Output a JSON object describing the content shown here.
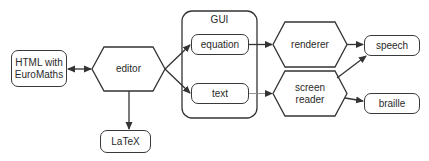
{
  "diagram": {
    "type": "flowchart",
    "nodes": {
      "html": {
        "label_line1": "HTML with",
        "label_line2": "EuroMaths",
        "shape": "rounded-rect"
      },
      "editor": {
        "label": "editor",
        "shape": "hexagon"
      },
      "latex": {
        "label": "LaTeX",
        "shape": "rounded-rect"
      },
      "gui": {
        "label": "GUI",
        "shape": "rounded-container"
      },
      "equation": {
        "label": "equation",
        "shape": "rounded-rect"
      },
      "text": {
        "label": "text",
        "shape": "rounded-rect"
      },
      "renderer": {
        "label": "renderer",
        "shape": "hexagon"
      },
      "screen_reader": {
        "label_line1": "screen",
        "label_line2": "reader",
        "shape": "hexagon"
      },
      "speech": {
        "label": "speech",
        "shape": "rounded-rect"
      },
      "braille": {
        "label": "braille",
        "shape": "rounded-rect"
      }
    },
    "edges": [
      {
        "from": "html",
        "to": "editor",
        "bidirectional": true
      },
      {
        "from": "editor",
        "to": "latex"
      },
      {
        "from": "editor",
        "to": "equation"
      },
      {
        "from": "editor",
        "to": "text"
      },
      {
        "from": "equation",
        "to": "renderer"
      },
      {
        "from": "text",
        "to": "screen_reader",
        "style": "light"
      },
      {
        "from": "renderer",
        "to": "speech"
      },
      {
        "from": "screen_reader",
        "to": "speech"
      },
      {
        "from": "screen_reader",
        "to": "braille"
      }
    ],
    "colors": {
      "stroke": "#333333",
      "light_stroke": "#888888",
      "text": "#2a2a2a",
      "background": "#ffffff"
    }
  }
}
